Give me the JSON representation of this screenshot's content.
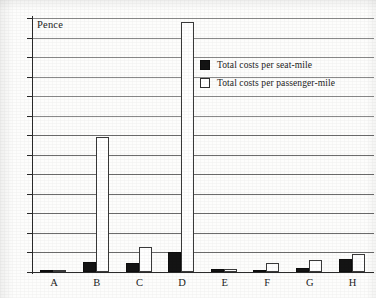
{
  "chart_data": {
    "type": "bar",
    "title": "",
    "unit_label": "Pence",
    "xlabel": "",
    "ylabel": "",
    "ylim": [
      0,
      26
    ],
    "ytick_step": 2,
    "grid": true,
    "legend_position": "upper-right-inside",
    "categories": [
      "A",
      "B",
      "C",
      "D",
      "E",
      "F",
      "G",
      "H"
    ],
    "ytick_labels": [
      "0",
      "2",
      "4",
      "6",
      "8",
      "10",
      "12",
      "14",
      "16",
      "18",
      "20",
      "22",
      "24",
      "26"
    ],
    "series": [
      {
        "name": "Total costs per seat-mile",
        "style": "filled-black",
        "values": [
          0.2,
          1.0,
          0.9,
          2.0,
          0.35,
          0.25,
          0.4,
          1.3
        ]
      },
      {
        "name": "Total costs per passenger-mile",
        "style": "outline-white",
        "values": [
          0.25,
          13.8,
          2.6,
          25.6,
          0.3,
          0.9,
          1.2,
          1.8
        ]
      }
    ]
  },
  "legend": {
    "items": [
      {
        "label": "Total costs per seat-mile",
        "swatch": "filled-square"
      },
      {
        "label": "Total costs per passenger-mile",
        "swatch": "outline-square"
      }
    ]
  },
  "colors": {
    "seat_mile": "#141414",
    "passenger_mile": "#ffffff",
    "outline": "#3a3a3a",
    "grid": "#6d6d6d",
    "axis": "#2a2a2a",
    "background": "#fdfdfc"
  }
}
